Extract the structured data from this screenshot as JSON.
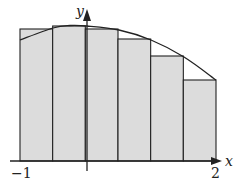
{
  "figure": {
    "x_axis_label": "x",
    "y_axis_label": "y",
    "tick_labels": {
      "left": "−1",
      "right": "2"
    },
    "colors": {
      "fill": "#dcdcdc",
      "stroke": "#222222",
      "background": "#ffffff"
    },
    "domain": [
      -1,
      2
    ],
    "subintervals": 6,
    "rectangle_edges_x": [
      -1,
      -0.5,
      0,
      0.5,
      1,
      1.5,
      2
    ],
    "rectangles": [
      {
        "x0": -1.0,
        "x1": -0.5,
        "top_px": 29
      },
      {
        "x0": -0.5,
        "x1": 0.0,
        "top_px": 26
      },
      {
        "x0": 0.0,
        "x1": 0.5,
        "top_px": 29
      },
      {
        "x0": 0.5,
        "x1": 1.0,
        "top_px": 39
      },
      {
        "x0": 1.0,
        "x1": 1.5,
        "top_px": 56
      },
      {
        "x0": 1.5,
        "x1": 2.0,
        "top_px": 80
      }
    ]
  }
}
